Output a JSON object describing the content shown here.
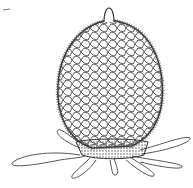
{
  "figure": {
    "colors": {
      "ink": "#333333",
      "background": "#ffffff",
      "stipple": "#555555"
    }
  }
}
